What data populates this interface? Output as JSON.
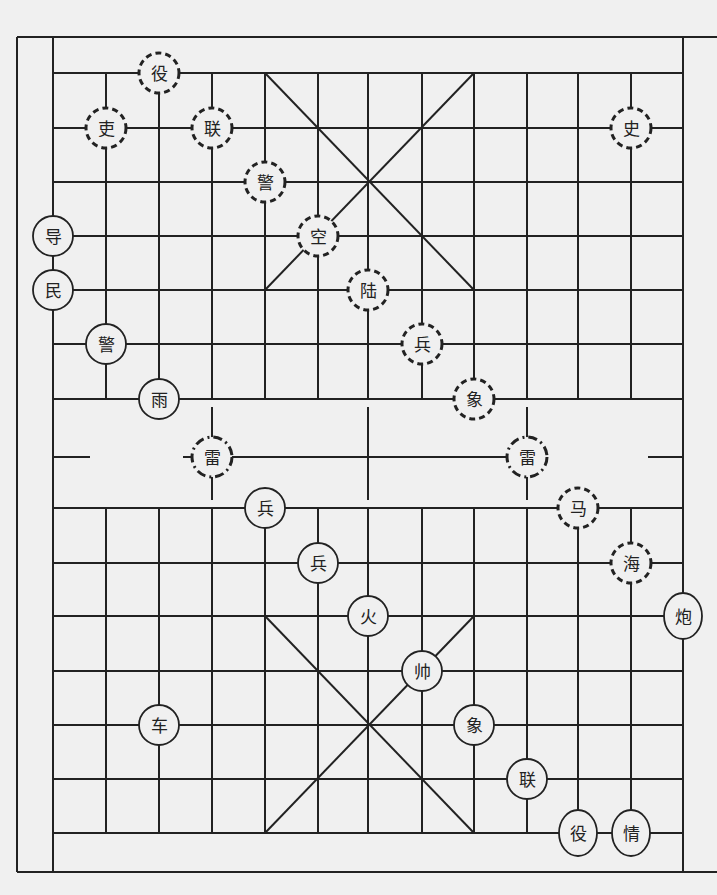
{
  "board": {
    "background": "#f0f0f0",
    "line_color": "#222222",
    "frame": {
      "left": 17,
      "top": 37,
      "right": 717,
      "bottom": 872
    },
    "inner_frame": {
      "left": 53,
      "right": 683
    },
    "columns_x": [
      53,
      106,
      159,
      212,
      265,
      318,
      368,
      422,
      474,
      527,
      578,
      631,
      683
    ],
    "rows_y_top": [
      73,
      128,
      182,
      236,
      290,
      344,
      399
    ],
    "rows_y_bottom": [
      508,
      563,
      616,
      671,
      725,
      779,
      833
    ],
    "river": {
      "top": 399,
      "bottom": 508,
      "center_y": 457,
      "center_line": {
        "x1": 183,
        "x2": 545
      },
      "left_stub": {
        "x1": 53,
        "x2": 90
      },
      "right_stub": {
        "x1": 648,
        "x2": 683
      },
      "vertical_stubs_x": [
        212,
        368,
        527
      ],
      "vertical_stub_range": [
        407,
        500
      ]
    },
    "palaces": [
      {
        "name": "top-palace",
        "x1": 265,
        "y1": 73,
        "x2": 474,
        "y2": 290
      },
      {
        "name": "bottom-palace",
        "x1": 265,
        "y1": 616,
        "x2": 474,
        "y2": 833
      }
    ]
  },
  "pieces": [
    {
      "label": "役",
      "x": 159,
      "y": 73,
      "style": "dashed",
      "side": "top"
    },
    {
      "label": "吏",
      "x": 106,
      "y": 128,
      "style": "dashed",
      "side": "top"
    },
    {
      "label": "联",
      "x": 212,
      "y": 128,
      "style": "dashed",
      "side": "top"
    },
    {
      "label": "史",
      "x": 631,
      "y": 128,
      "style": "dashed",
      "side": "top"
    },
    {
      "label": "警",
      "x": 265,
      "y": 182,
      "style": "dashed",
      "side": "top"
    },
    {
      "label": "空",
      "x": 318,
      "y": 236,
      "style": "dashed",
      "side": "top"
    },
    {
      "label": "陆",
      "x": 368,
      "y": 290,
      "style": "dashed",
      "side": "top"
    },
    {
      "label": "兵",
      "x": 422,
      "y": 344,
      "style": "dashed",
      "side": "top"
    },
    {
      "label": "象",
      "x": 474,
      "y": 399,
      "style": "dashed",
      "side": "top"
    },
    {
      "label": "马",
      "x": 578,
      "y": 508,
      "style": "dashed",
      "side": "top"
    },
    {
      "label": "海",
      "x": 631,
      "y": 563,
      "style": "dashed",
      "side": "top"
    },
    {
      "label": "雷",
      "x": 212,
      "y": 457,
      "style": "dashdot",
      "side": "river"
    },
    {
      "label": "雷",
      "x": 527,
      "y": 457,
      "style": "dashdot",
      "side": "river"
    },
    {
      "label": "导",
      "x": 53,
      "y": 236,
      "style": "solid",
      "side": "bottom"
    },
    {
      "label": "民",
      "x": 53,
      "y": 290,
      "style": "solid",
      "side": "bottom"
    },
    {
      "label": "警",
      "x": 106,
      "y": 344,
      "style": "solid",
      "side": "bottom"
    },
    {
      "label": "雨",
      "x": 159,
      "y": 399,
      "style": "solid",
      "side": "bottom"
    },
    {
      "label": "兵",
      "x": 265,
      "y": 508,
      "style": "solid",
      "side": "bottom"
    },
    {
      "label": "兵",
      "x": 318,
      "y": 563,
      "style": "solid",
      "side": "bottom"
    },
    {
      "label": "火",
      "x": 368,
      "y": 616,
      "style": "solid",
      "side": "bottom"
    },
    {
      "label": "炮",
      "x": 683,
      "y": 616,
      "style": "solid",
      "side": "bottom"
    },
    {
      "label": "帅",
      "x": 422,
      "y": 671,
      "style": "solid",
      "side": "bottom"
    },
    {
      "label": "车",
      "x": 159,
      "y": 725,
      "style": "solid",
      "side": "bottom"
    },
    {
      "label": "象",
      "x": 474,
      "y": 725,
      "style": "solid",
      "side": "bottom"
    },
    {
      "label": "联",
      "x": 527,
      "y": 779,
      "style": "solid",
      "side": "bottom"
    },
    {
      "label": "役",
      "x": 578,
      "y": 833,
      "style": "solid",
      "side": "bottom"
    },
    {
      "label": "情",
      "x": 631,
      "y": 833,
      "style": "solid",
      "side": "bottom"
    }
  ]
}
